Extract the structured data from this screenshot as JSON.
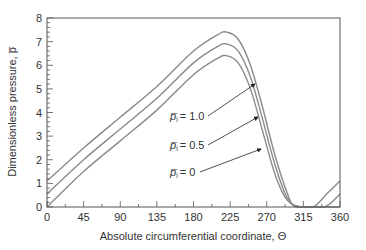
{
  "chart_data": {
    "type": "line",
    "title": "",
    "xlabel": "Absolute circumferential coordinate, Θ",
    "ylabel": "Dimensionless pressure, p̅",
    "xlim": [
      0,
      360
    ],
    "ylim": [
      0,
      8
    ],
    "xticks": [
      0,
      45,
      90,
      135,
      180,
      225,
      270,
      315,
      360
    ],
    "yticks": [
      0,
      1,
      2,
      3,
      4,
      5,
      6,
      7,
      8
    ],
    "grid": false,
    "legend_position": "annotations with arrows",
    "series": [
      {
        "name": "p̅i = 1.0",
        "x": [
          0,
          45,
          90,
          135,
          180,
          210,
          221,
          235,
          250,
          265,
          280,
          295,
          305,
          327,
          345,
          360
        ],
        "y": [
          1.1,
          2.5,
          3.8,
          5.1,
          6.6,
          7.3,
          7.4,
          7.1,
          6.0,
          4.2,
          2.2,
          0.6,
          0.0,
          0.0,
          0.6,
          1.1
        ]
      },
      {
        "name": "p̅i = 0.5",
        "x": [
          0,
          45,
          90,
          135,
          180,
          210,
          221,
          235,
          250,
          265,
          280,
          295,
          310,
          341,
          360
        ],
        "y": [
          0.55,
          2.0,
          3.3,
          4.6,
          6.1,
          6.8,
          6.9,
          6.6,
          5.5,
          3.7,
          1.8,
          0.4,
          0.0,
          0.0,
          0.55
        ]
      },
      {
        "name": "p̅i = 0",
        "x": [
          0,
          45,
          90,
          135,
          180,
          210,
          221,
          235,
          250,
          265,
          280,
          295,
          316,
          360
        ],
        "y": [
          0.0,
          1.5,
          2.8,
          4.1,
          5.6,
          6.3,
          6.4,
          6.1,
          5.0,
          3.2,
          1.4,
          0.3,
          0.0,
          0.0
        ]
      }
    ],
    "annotations": [
      {
        "label_main": "p̅",
        "label_sub": "i",
        "text": " = 1.0",
        "series": 0
      },
      {
        "label_main": "p̅",
        "label_sub": "i",
        "text": " = 0.5",
        "series": 1
      },
      {
        "label_main": "p̅",
        "label_sub": "i",
        "text": " = 0",
        "series": 2
      }
    ],
    "line_color": "#8a8a8a",
    "axis_color": "#555555"
  },
  "labels": {
    "xlabel": "Absolute circumferential coordinate, Θ",
    "ylabel": "Dimensionless pressure, p̅",
    "ann0": "= 1.0",
    "ann1": "= 0.5",
    "ann2": "= 0"
  }
}
